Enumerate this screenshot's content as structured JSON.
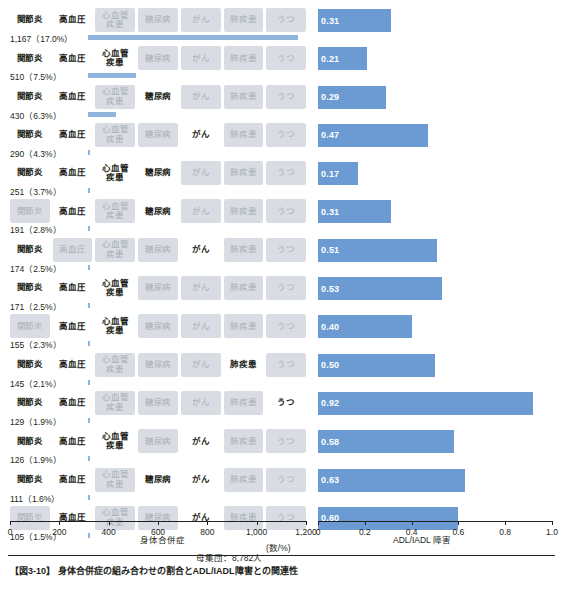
{
  "chart_data": {
    "type": "bar",
    "title": "身体合併症の組み合わせの割合とADL/IADL障害との関連性",
    "left": {
      "xlabel": "身体合併症",
      "xunit": "(数/%)",
      "xticks": [
        "0",
        "200",
        "400",
        "600",
        "800",
        "1,000",
        "1,200"
      ],
      "xlim": [
        0,
        1200
      ],
      "note": "母集団：8,782人"
    },
    "right": {
      "xlabel": "ADL/IADL 障害",
      "xticks": [
        "0",
        "0.2",
        "0.4",
        "0.6",
        "0.8",
        "1.0"
      ],
      "xlim": [
        0,
        1.0
      ]
    },
    "conditions": [
      "関節炎",
      "高血圧",
      "心血管\n疾患",
      "糖尿病",
      "がん",
      "肺疾患",
      "うつ"
    ],
    "rows": [
      {
        "active": [
          1,
          1,
          0,
          0,
          0,
          0,
          0
        ],
        "count": 1167,
        "pct": "17.0%",
        "label": "1,167（17.0%）",
        "adl": 0.31
      },
      {
        "active": [
          1,
          1,
          1,
          0,
          0,
          0,
          0
        ],
        "count": 510,
        "pct": "7.5%",
        "label": "510（7.5%）",
        "adl": 0.21
      },
      {
        "active": [
          1,
          1,
          0,
          1,
          0,
          0,
          0
        ],
        "count": 430,
        "pct": "6.3%",
        "label": "430（6.3%）",
        "adl": 0.29
      },
      {
        "active": [
          1,
          1,
          0,
          0,
          1,
          0,
          0
        ],
        "count": 290,
        "pct": "4.3%",
        "label": "290（4.3%）",
        "adl": 0.47
      },
      {
        "active": [
          1,
          1,
          1,
          1,
          0,
          0,
          0
        ],
        "count": 251,
        "pct": "3.7%",
        "label": "251（3.7%）",
        "adl": 0.17
      },
      {
        "active": [
          0,
          1,
          0,
          1,
          0,
          0,
          0
        ],
        "count": 191,
        "pct": "2.8%",
        "label": "191（2.8%）",
        "adl": 0.31
      },
      {
        "active": [
          1,
          0,
          0,
          0,
          1,
          0,
          0
        ],
        "count": 174,
        "pct": "2.5%",
        "label": "174（2.5%）",
        "adl": 0.51
      },
      {
        "active": [
          1,
          1,
          1,
          0,
          0,
          0,
          0
        ],
        "count": 171,
        "pct": "2.5%",
        "label": "171（2.5%）",
        "adl": 0.53
      },
      {
        "active": [
          0,
          1,
          1,
          0,
          0,
          0,
          0
        ],
        "count": 155,
        "pct": "2.3%",
        "label": "155（2.3%）",
        "adl": 0.4
      },
      {
        "active": [
          1,
          1,
          0,
          0,
          0,
          1,
          0
        ],
        "count": 145,
        "pct": "2.1%",
        "label": "145（2.1%）",
        "adl": 0.5
      },
      {
        "active": [
          1,
          1,
          0,
          0,
          0,
          0,
          1
        ],
        "count": 129,
        "pct": "1.9%",
        "label": "129（1.9%）",
        "adl": 0.92
      },
      {
        "active": [
          1,
          1,
          1,
          0,
          1,
          0,
          0
        ],
        "count": 126,
        "pct": "1.9%",
        "label": "126（1.9%）",
        "adl": 0.58
      },
      {
        "active": [
          1,
          1,
          0,
          1,
          1,
          0,
          0
        ],
        "count": 111,
        "pct": "1.6%",
        "label": "111（1.6%）",
        "adl": 0.63
      },
      {
        "active": [
          0,
          1,
          0,
          0,
          1,
          0,
          0
        ],
        "count": 105,
        "pct": "1.5%",
        "label": "105（1.5%）",
        "adl": 0.6
      }
    ],
    "colors": {
      "bar": "#6b9bd2",
      "bar_left": "#8fb4dd",
      "chip_off_bg": "#d9dde3",
      "chip_off_text": "#a7adb6",
      "text": "#231f20"
    }
  },
  "caption": "【図3-10】 身体合併症の組み合わせの割合とADL/IADL障害との関連性"
}
